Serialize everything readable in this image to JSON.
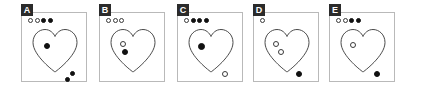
{
  "figure": {
    "type": "multi-panel-figure",
    "panel_count": 5,
    "background_color": "#ffffff",
    "frame_color": "#b9b9b9",
    "label_background": "#2b2b2b",
    "label_color": "#ffffff",
    "marker_fill_color": "#111111",
    "marker_outline_color": "#3a3a3a"
  },
  "panels": [
    {
      "label": "A",
      "x": 18,
      "header_dots": [
        "open",
        "open",
        "filled",
        "filled"
      ],
      "header_dot_count": 4,
      "header_open_count": 2,
      "header_filled_count": 2,
      "shape": "heart",
      "markers": [
        {
          "style": "filled",
          "x": 14,
          "y": 17,
          "size": 6,
          "location": "inside-upper-left"
        },
        {
          "style": "filled",
          "x": 40,
          "y": 45,
          "size": 5,
          "location": "outside-lower-right"
        },
        {
          "style": "filled",
          "x": 35,
          "y": 51,
          "size": 5,
          "location": "outside-lower-right"
        }
      ]
    },
    {
      "label": "B",
      "x": 96,
      "header_dots": [
        "open",
        "open",
        "open"
      ],
      "header_dot_count": 3,
      "header_open_count": 3,
      "header_filled_count": 0,
      "shape": "heart",
      "markers": [
        {
          "style": "open",
          "x": 12,
          "y": 15,
          "size": 6,
          "location": "inside-upper-left"
        },
        {
          "style": "filled",
          "x": 14,
          "y": 23,
          "size": 6,
          "location": "inside-upper-left"
        }
      ]
    },
    {
      "label": "C",
      "x": 174,
      "header_dots": [
        "open",
        "filled",
        "filled",
        "filled"
      ],
      "header_dot_count": 4,
      "header_open_count": 1,
      "header_filled_count": 3,
      "shape": "heart",
      "markers": [
        {
          "style": "filled",
          "x": 12,
          "y": 17,
          "size": 7,
          "location": "inside-upper-left"
        },
        {
          "style": "open",
          "x": 36,
          "y": 45,
          "size": 6,
          "location": "outside-lower-right"
        }
      ]
    },
    {
      "label": "D",
      "x": 250,
      "header_dots": [
        "open"
      ],
      "header_dot_count": 1,
      "header_open_count": 1,
      "header_filled_count": 0,
      "shape": "heart",
      "markers": [
        {
          "style": "open",
          "x": 11,
          "y": 15,
          "size": 6,
          "location": "inside-upper-left"
        },
        {
          "style": "open",
          "x": 16,
          "y": 23,
          "size": 6,
          "location": "inside-upper-left"
        },
        {
          "style": "filled",
          "x": 34,
          "y": 45,
          "size": 6,
          "location": "outside-lower-right"
        }
      ]
    },
    {
      "label": "E",
      "x": 326,
      "header_dots": [
        "open",
        "open",
        "filled",
        "filled"
      ],
      "header_dot_count": 4,
      "header_open_count": 2,
      "header_filled_count": 2,
      "shape": "heart",
      "markers": [
        {
          "style": "open",
          "x": 12,
          "y": 16,
          "size": 6,
          "location": "inside-upper-left"
        },
        {
          "style": "filled",
          "x": 36,
          "y": 45,
          "size": 6,
          "location": "outside-lower-right"
        }
      ]
    }
  ]
}
